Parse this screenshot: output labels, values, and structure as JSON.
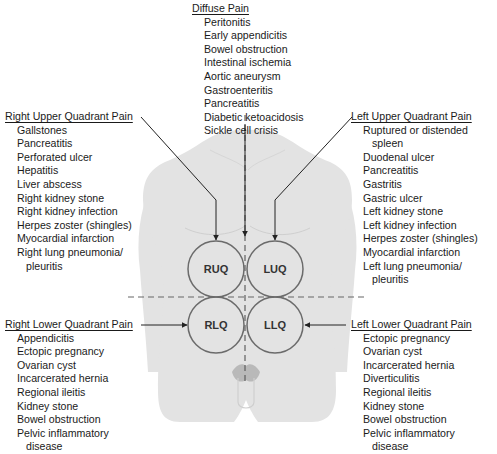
{
  "diagram": {
    "colors": {
      "body_fill": "#e3e3e3",
      "body_shadow": "#d2d2d2",
      "circle_stroke": "#6b6b6b",
      "line": "#222222",
      "dashed": "#666666",
      "groin": "#b9b9b9"
    },
    "quadrants": [
      {
        "code": "RUQ",
        "cx": 216,
        "cy": 269,
        "r": 28
      },
      {
        "code": "LUQ",
        "cx": 275,
        "cy": 269,
        "r": 28
      },
      {
        "code": "RLQ",
        "cx": 216,
        "cy": 325,
        "r": 28
      },
      {
        "code": "LLQ",
        "cx": 275,
        "cy": 325,
        "r": 28
      }
    ],
    "groups": {
      "diffuse": {
        "title": "Diffuse Pain",
        "items": [
          "Peritonitis",
          "Early appendicitis",
          "Bowel obstruction",
          "Intestinal ischemia",
          "Aortic aneurysm",
          "Gastroenteritis",
          "Pancreatitis",
          "Diabetic ketoacidosis",
          "Sickle cell crisis"
        ]
      },
      "ruq": {
        "title": "Right Upper Quadrant Pain",
        "items": [
          "Gallstones",
          "Pancreatitis",
          "Perforated ulcer",
          "Hepatitis",
          "Liver abscess",
          "Right kidney stone",
          "Right kidney infection",
          "Herpes zoster (shingles)",
          "Myocardial infarction",
          "Right lung pneumonia/",
          "pleuritis"
        ]
      },
      "luq": {
        "title": "Left Upper Quadrant Pain",
        "items": [
          "Ruptured or distended",
          "spleen",
          "Duodenal ulcer",
          "Pancreatitis",
          "Gastritis",
          "Gastric ulcer",
          "Left kidney stone",
          "Left kidney infection",
          "Herpes zoster (shingles)",
          "Myocardial infarction",
          "Left lung pneumonia/",
          "pleuritis"
        ]
      },
      "rlq": {
        "title": "Right Lower Quadrant Pain",
        "items": [
          "Appendicitis",
          "Ectopic pregnancy",
          "Ovarian cyst",
          "Incarcerated hernia",
          "Regional ileitis",
          "Kidney stone",
          "Bowel obstruction",
          "Pelvic inflammatory",
          "disease"
        ]
      },
      "llq": {
        "title": "Left Lower Quadrant Pain",
        "items": [
          "Ectopic pregnancy",
          "Ovarian cyst",
          "Incarcerated hernia",
          "Diverticulitis",
          "Regional ileitis",
          "Kidney stone",
          "Bowel obstruction",
          "Pelvic inflammatory",
          "disease"
        ]
      }
    }
  }
}
